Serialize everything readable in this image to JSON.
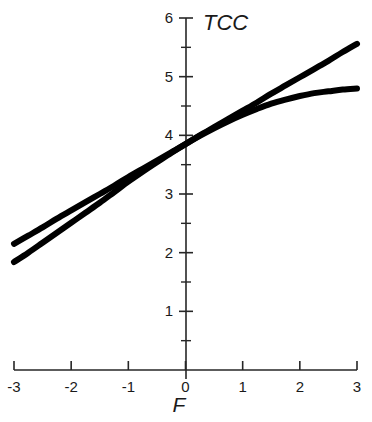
{
  "chart_data": {
    "type": "line",
    "title": "TCC",
    "xlabel": "F",
    "ylabel": "",
    "xlim": [
      -3,
      3
    ],
    "ylim": [
      0,
      6
    ],
    "grid": false,
    "legend": "none",
    "x_ticks": [
      "-3",
      "-2",
      "-1",
      "0",
      "1",
      "2",
      "3"
    ],
    "x_tick_values": [
      -3,
      -2,
      -1,
      0,
      1,
      2,
      3
    ],
    "y_ticks": [
      "1",
      "2",
      "3",
      "4",
      "5",
      "6"
    ],
    "y_tick_values": [
      1,
      2,
      3,
      4,
      5,
      6
    ],
    "y_minor_tick_values": [
      0.5,
      1.5,
      2.5,
      3.5,
      4.5,
      5.5
    ],
    "x": [
      -3,
      -2.75,
      -2.5,
      -2.25,
      -2,
      -1.75,
      -1.5,
      -1.25,
      -1,
      -0.75,
      -0.5,
      -0.25,
      0,
      0.25,
      0.5,
      0.75,
      1,
      1.25,
      1.5,
      1.75,
      2,
      2.25,
      2.5,
      2.75,
      3
    ],
    "series": [
      {
        "name": "linear",
        "style": "straight-line",
        "values": [
          2.15,
          2.29,
          2.43,
          2.58,
          2.72,
          2.86,
          3.0,
          3.14,
          3.29,
          3.43,
          3.57,
          3.71,
          3.85,
          4.0,
          4.14,
          4.28,
          4.42,
          4.56,
          4.71,
          4.85,
          4.99,
          5.13,
          5.27,
          5.42,
          5.56
        ]
      },
      {
        "name": "curved",
        "style": "logistic-curve",
        "values": [
          1.84,
          2.0,
          2.17,
          2.34,
          2.51,
          2.68,
          2.85,
          3.03,
          3.21,
          3.38,
          3.54,
          3.7,
          3.85,
          3.99,
          4.12,
          4.24,
          4.35,
          4.45,
          4.54,
          4.61,
          4.67,
          4.72,
          4.75,
          4.78,
          4.8
        ]
      }
    ]
  }
}
